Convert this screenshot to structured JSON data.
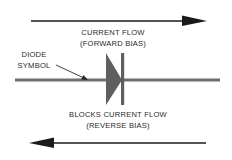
{
  "diagram": {
    "forward": {
      "line1": "CURRENT FLOW",
      "line2": "(FORWARD BIAS)"
    },
    "diode_label": {
      "line1": "DIODE",
      "line2": "SYMBOL"
    },
    "reverse": {
      "line1": "BLOCKS CURRENT FLOW",
      "line2": "(REVERSE BIAS)"
    },
    "colors": {
      "arrow": "#1a1a1a",
      "wire": "#6f6f6f",
      "diode": "#606060",
      "text": "#2a2a2a"
    }
  }
}
